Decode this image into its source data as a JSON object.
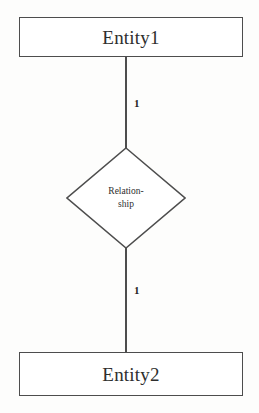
{
  "diagram": {
    "type": "entity-relationship-diagram",
    "notation": "Chen",
    "stroke_color": "#4d4d4d",
    "background_color": "#fdfdfc",
    "text_color": "#2e2e2e"
  },
  "entities": [
    {
      "id": "entity-top",
      "label": "Entity1"
    },
    {
      "id": "entity-bottom",
      "label": "Entity2"
    }
  ],
  "relationship": {
    "label_line1": "Relation-",
    "label_line2": "ship",
    "full_label": "Relationship"
  },
  "cardinalities": {
    "top": "1",
    "bottom": "1"
  }
}
